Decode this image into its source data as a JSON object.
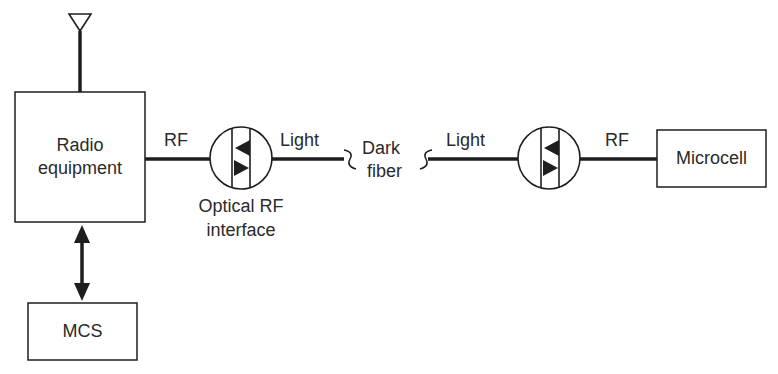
{
  "diagram": {
    "blocks": {
      "radio_equipment": {
        "label_line1": "Radio",
        "label_line2": "equipment"
      },
      "mcs": {
        "label": "MCS"
      },
      "microcell": {
        "label": "Microcell"
      }
    },
    "interfaces": {
      "optical_rf_interface_left": {
        "caption_line1": "Optical RF",
        "caption_line2": "interface"
      }
    },
    "links": {
      "rf_left": "RF",
      "light_left": "Light",
      "dark_fiber_line1": "Dark",
      "dark_fiber_line2": "fiber",
      "light_right": "Light",
      "rf_right": "RF"
    },
    "symbols": [
      "antenna-icon",
      "bidirectional-arrow",
      "optical-transceiver-icon",
      "fiber-break-icon"
    ],
    "colors": {
      "line": "#1e1e1e",
      "text": "#2a2a2a",
      "background": "#ffffff"
    }
  }
}
